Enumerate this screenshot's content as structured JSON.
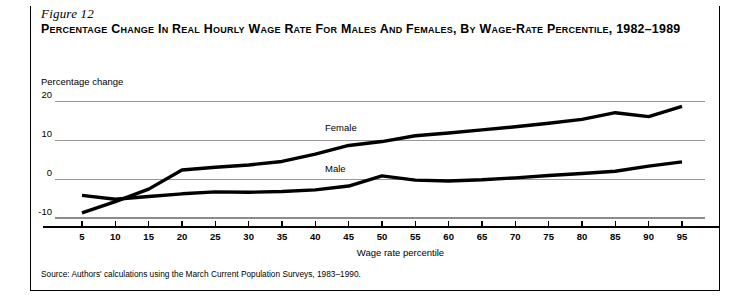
{
  "figure": {
    "number": "Figure 12",
    "title": "Percentage Change in Real Hourly Wage Rate for Males and Females, by Wage-Rate Percentile, 1982–1989",
    "source": "Source: Authors' calculations using the March Current Population Surveys, 1983–1990."
  },
  "colors": {
    "line": "#000000",
    "grid": "#8c8c8c",
    "axis": "#000000",
    "background": "#ffffff",
    "text": "#000000"
  },
  "chart_data": {
    "type": "line",
    "title": "Percentage Change in Real Hourly Wage Rate for Males and Females, by Wage-Rate Percentile, 1982–1989",
    "xlabel": "Wage rate percentile",
    "ylabel": "Percentage change",
    "x": [
      5,
      10,
      15,
      20,
      25,
      30,
      35,
      40,
      45,
      50,
      55,
      60,
      65,
      70,
      75,
      80,
      85,
      90,
      95
    ],
    "xtick_labels": [
      "5",
      "10",
      "15",
      "20",
      "25",
      "30",
      "35",
      "40",
      "45",
      "50",
      "55",
      "60",
      "65",
      "70",
      "75",
      "80",
      "85",
      "90",
      "95"
    ],
    "ytick_labels": [
      "20",
      "10",
      "0",
      "-10"
    ],
    "yticks": [
      20,
      10,
      0,
      -10
    ],
    "xlim": [
      2.5,
      97.5
    ],
    "ylim": [
      -12,
      21
    ],
    "grid": true,
    "grid_axis": "y",
    "legend": "inline-labels",
    "series": [
      {
        "name": "Female",
        "label": "Female",
        "label_x": 50,
        "label_y": 13.2,
        "values": [
          -8.7,
          -5.8,
          -2.6,
          2.3,
          3.0,
          3.6,
          4.5,
          6.4,
          8.6,
          9.6,
          11.1,
          11.8,
          12.6,
          13.4,
          14.3,
          15.3,
          17.0,
          16.0,
          18.6
        ]
      },
      {
        "name": "Male",
        "label": "Male",
        "label_x": 50,
        "label_y": 2.5,
        "values": [
          -4.2,
          -5.2,
          -4.5,
          -3.8,
          -3.3,
          -3.4,
          -3.2,
          -2.8,
          -1.8,
          0.8,
          -0.3,
          -0.5,
          -0.2,
          0.3,
          0.9,
          1.4,
          2.0,
          3.3,
          4.4
        ]
      }
    ]
  }
}
